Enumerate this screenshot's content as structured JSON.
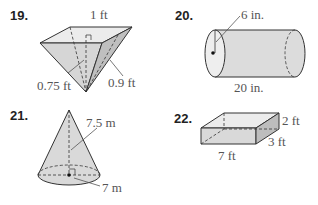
{
  "problems": [
    {
      "number": "19.",
      "shape": "square pyramid (inverted)",
      "labels": {
        "top_edge": "1 ft",
        "height": "0.75 ft",
        "slant": "0.9 ft"
      }
    },
    {
      "number": "20.",
      "shape": "cylinder",
      "labels": {
        "radius": "6 in.",
        "length": "20 in."
      }
    },
    {
      "number": "21.",
      "shape": "cone",
      "labels": {
        "slant_height": "7.5 m",
        "radius": "7 m"
      }
    },
    {
      "number": "22.",
      "shape": "rectangular prism",
      "labels": {
        "height": "2 ft",
        "width": "3 ft",
        "length": "7 ft"
      }
    }
  ],
  "colors": {
    "fill_light": "#e6e6e6",
    "fill_mid": "#d2d2d2",
    "fill_dark": "#bdbdbd",
    "stroke": "#333333",
    "label": "#555555"
  }
}
